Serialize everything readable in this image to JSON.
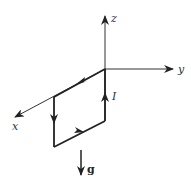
{
  "diagram": {
    "type": "current-loop-axes",
    "colors": {
      "stroke": "#222222",
      "axis": "#333333",
      "background": "#ffffff"
    },
    "axes": [
      {
        "id": "z",
        "label": "z"
      },
      {
        "id": "y",
        "label": "y"
      },
      {
        "id": "x",
        "label": "x"
      }
    ],
    "current_label": "I",
    "gravity_label": "g",
    "loop_edges": [
      {
        "id": "top",
        "direction": "toward-x"
      },
      {
        "id": "left",
        "direction": "down"
      },
      {
        "id": "bottom",
        "direction": "toward-y"
      },
      {
        "id": "right",
        "direction": "up"
      }
    ]
  }
}
